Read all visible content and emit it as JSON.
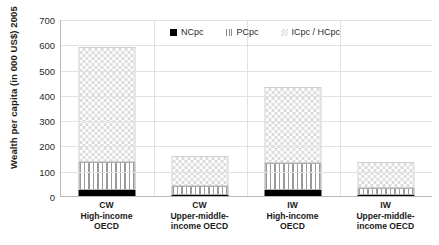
{
  "chart_data": {
    "type": "bar",
    "title": "",
    "subtitle": "",
    "xlabel": "",
    "ylabel": "Wealth per capita (in 000 US$) 2005",
    "ylim": [
      0,
      700
    ],
    "yticks": [
      0,
      100,
      200,
      300,
      400,
      500,
      600,
      700
    ],
    "ytick_labels": [
      "0",
      "100",
      "200",
      "300",
      "400",
      "500",
      "600",
      "700"
    ],
    "grid": true,
    "stacked": true,
    "legend_position": "top-center",
    "categories": [
      "CW\nHigh-income\nOECD",
      "CW\nUpper-middle-\nincome OECD",
      "IW\nHigh-income\nOECD",
      "IW\nUpper-middle-\nincome OECD"
    ],
    "category_lines": [
      [
        "CW",
        "High-income",
        "OECD"
      ],
      [
        "CW",
        "Upper-middle-",
        "income OECD"
      ],
      [
        "IW",
        "High-income",
        "OECD"
      ],
      [
        "IW",
        "Upper-middle-",
        "income OECD"
      ]
    ],
    "series": [
      {
        "name": "NCpc",
        "values": [
          25,
          4,
          25,
          3
        ],
        "pattern": "solid-black",
        "color": "#000000"
      },
      {
        "name": "PCpc",
        "values": [
          110,
          36,
          105,
          30
        ],
        "pattern": "vertical-stripes",
        "color": "#9a9a9a"
      },
      {
        "name": "ICpc / HCpc",
        "values": [
          455,
          120,
          300,
          102
        ],
        "pattern": "checkerboard",
        "color": "#dcdcdc"
      }
    ],
    "totals": [
      590,
      160,
      430,
      135
    ],
    "legend": [
      {
        "label": "NCpc",
        "swatch": "solid-black"
      },
      {
        "label": "PCpc",
        "swatch": "vertical-stripes"
      },
      {
        "label": "ICpc / HCpc",
        "swatch": "checkerboard"
      }
    ]
  }
}
